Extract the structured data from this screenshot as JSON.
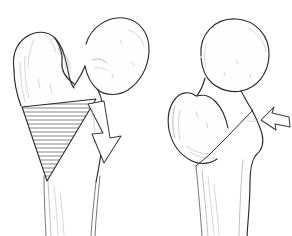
{
  "figure": {
    "background_color": "#ffffff",
    "ink_color": "#2b2b2b",
    "shading_color": "#8a8a8a",
    "width": 292,
    "height": 236,
    "style": "pen-and-ink medical line drawing",
    "panel_count": 2
  },
  "panels": [
    {
      "id": "left",
      "label": "pre-osteotomy",
      "caption": "",
      "structures": [
        {
          "name": "femoral-head",
          "label": "Femoral head"
        },
        {
          "name": "femoral-neck",
          "label": "Femoral neck"
        },
        {
          "name": "greater-trochanter",
          "label": "Greater trochanter"
        },
        {
          "name": "lesser-trochanter",
          "label": "Lesser trochanter"
        },
        {
          "name": "femoral-shaft",
          "label": "Femoral shaft"
        },
        {
          "name": "resection-wedge",
          "label": "Hatched resection wedge"
        }
      ],
      "wedge": {
        "name": "resection-wedge",
        "label": "Wedge of bone to be removed",
        "fill_pattern": "horizontal-hatching",
        "hatch_line_count": 22,
        "hatch_color": "#3a3a3a",
        "apex": "bottom-left",
        "base": "upper-right"
      },
      "arrow": {
        "name": "correction-arrow",
        "label": "Direction of correction",
        "direction": "down-right",
        "style": "hollow-outline",
        "size": "large"
      }
    },
    {
      "id": "right",
      "label": "post-osteotomy",
      "caption": "",
      "structures": [
        {
          "name": "femoral-head",
          "label": "Femoral head"
        },
        {
          "name": "femoral-neck",
          "label": "Femoral neck"
        },
        {
          "name": "greater-trochanter",
          "label": "Greater trochanter"
        },
        {
          "name": "femoral-shaft",
          "label": "Femoral shaft"
        },
        {
          "name": "osteotomy-cut",
          "label": "Apposed osteotomy surfaces"
        }
      ],
      "cut": {
        "name": "osteotomy-cut-line",
        "label": "Osteotomy cut line",
        "orientation": "oblique-down-left"
      },
      "arrow": {
        "name": "compression-arrow",
        "label": "Compression direction",
        "direction": "left",
        "style": "hollow-outline",
        "size": "small"
      }
    }
  ]
}
